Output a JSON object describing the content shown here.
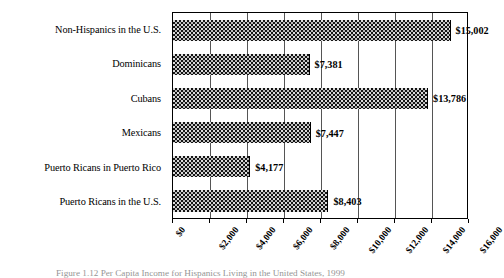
{
  "chart_data": {
    "type": "bar",
    "orientation": "horizontal",
    "title": "",
    "xlabel": "",
    "ylabel": "",
    "categories": [
      "Non-Hispanics in the U.S.",
      "Dominicans",
      "Cubans",
      "Mexicans",
      "Puerto Ricans in Puerto Rico",
      "Puerto Ricans in the U.S."
    ],
    "values": [
      15002,
      7381,
      13786,
      7447,
      4177,
      8403
    ],
    "value_labels": [
      "$15,002",
      "$7,381",
      "$13,786",
      "$7,447",
      "$4,177",
      "$8,403"
    ],
    "xlim": [
      0,
      16000
    ],
    "xticks": [
      0,
      2000,
      4000,
      6000,
      8000,
      10000,
      12000,
      14000,
      16000
    ],
    "xticklabels": [
      "$0",
      "$2,000",
      "$4,000",
      "$6,000",
      "$8,000",
      "$10,000",
      "$12,000",
      "$14,000",
      "$16,000"
    ],
    "grid": true,
    "grid_axis": "x",
    "legend": false,
    "bar_fill": "dark-dotted-crosshatch",
    "bar_color": "#141414",
    "frame_color": "#000000"
  },
  "caption": {
    "text": "Figure 1.12   Per Capita Income for Hispanics Living in the United States, 1999"
  }
}
